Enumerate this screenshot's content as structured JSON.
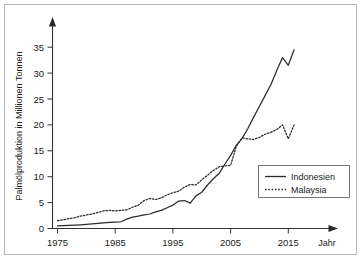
{
  "chart_data": {
    "type": "line",
    "title": "",
    "xlabel": "Jahr",
    "ylabel": "Palmölproduktion in Millionen Tonnen",
    "xlim": [
      1975,
      2017
    ],
    "ylim": [
      0,
      37
    ],
    "xticks": [
      1975,
      1985,
      1995,
      2005,
      2015
    ],
    "xtick_labels": [
      "1975",
      "1985",
      "1995",
      "2005",
      "2015"
    ],
    "yticks": [
      0,
      5,
      10,
      15,
      20,
      25,
      30,
      35
    ],
    "ytick_labels": [
      "0",
      "5",
      "10",
      "15",
      "20",
      "25",
      "30",
      "35"
    ],
    "grid": false,
    "legend_position": "center-right",
    "x": [
      1975,
      1976,
      1977,
      1978,
      1979,
      1980,
      1981,
      1982,
      1983,
      1984,
      1985,
      1986,
      1987,
      1988,
      1989,
      1990,
      1991,
      1992,
      1993,
      1994,
      1995,
      1996,
      1997,
      1998,
      1999,
      2000,
      2001,
      2002,
      2003,
      2004,
      2005,
      2006,
      2007,
      2008,
      2009,
      2010,
      2011,
      2012,
      2013,
      2014,
      2015,
      2016
    ],
    "series": [
      {
        "name": "Indonesien",
        "style": "solid",
        "values": [
          0.5,
          0.55,
          0.6,
          0.65,
          0.72,
          0.8,
          0.9,
          1.0,
          1.1,
          1.2,
          1.25,
          1.3,
          1.8,
          2.2,
          2.4,
          2.65,
          2.8,
          3.2,
          3.5,
          4.0,
          4.5,
          5.3,
          5.4,
          4.9,
          6.3,
          7.0,
          8.4,
          9.6,
          10.6,
          12.4,
          14.1,
          16.1,
          17.4,
          19.3,
          21.5,
          23.6,
          25.7,
          27.8,
          30.5,
          33.0,
          31.5,
          34.5
        ]
      },
      {
        "name": "Malaysia",
        "style": "dotted",
        "values": [
          1.5,
          1.7,
          1.9,
          2.1,
          2.4,
          2.6,
          2.8,
          3.1,
          3.4,
          3.5,
          3.4,
          3.5,
          3.6,
          4.1,
          4.5,
          5.4,
          5.8,
          5.6,
          5.9,
          6.5,
          6.9,
          7.2,
          8.0,
          8.5,
          8.4,
          9.4,
          10.3,
          11.2,
          11.9,
          12.1,
          12.2,
          12.8,
          13.1,
          13.5,
          14.6,
          15.2,
          15.4,
          14.6,
          16.5,
          17.0,
          17.3,
          17.0
        ]
      }
    ],
    "malaysia_extra": {
      "x": [
        2006,
        2007,
        2008,
        2009,
        2010,
        2011,
        2012,
        2013,
        2014,
        2015,
        2016
      ],
      "values": [
        15.9,
        17.5,
        17.3,
        17.2,
        17.6,
        18.2,
        18.6,
        19.1,
        20.0,
        17.3,
        20.0
      ]
    },
    "annotations": []
  },
  "legend": {
    "entries": [
      {
        "label": "Indonesien",
        "style": "solid"
      },
      {
        "label": "Malaysia",
        "style": "dotted"
      }
    ]
  },
  "axes": {
    "x_axis_label": "Jahr",
    "y_axis_label": "Palmölproduktion in Millionen Tonnen"
  }
}
